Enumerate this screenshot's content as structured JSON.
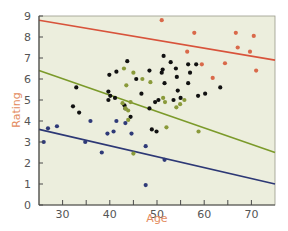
{
  "chart_data": {
    "type": "scatter",
    "title": "",
    "xlabel": "Age",
    "ylabel": "Rating",
    "xlim": [
      25,
      75
    ],
    "ylim": [
      0,
      9
    ],
    "x_ticks": [
      30,
      40,
      50,
      60,
      70
    ],
    "x_minor_ticks": [
      35,
      45,
      55,
      65
    ],
    "y_ticks": [
      0,
      1,
      2,
      3,
      4,
      5,
      6,
      7,
      8,
      9
    ],
    "grid": false,
    "legend": null,
    "colors": {
      "background": "#eceedd",
      "axis": "#4a4a4a",
      "label": "#e38b5e",
      "orange": "#d9694a",
      "black": "#111111",
      "green": "#8a9a3a",
      "blue": "#2f3a78",
      "line_orange": "#d8533b",
      "line_green": "#7b9a2a",
      "line_blue": "#2d3875"
    },
    "series": [
      {
        "name": "orange",
        "points": [
          [
            51,
            8.8
          ],
          [
            57.9,
            8.2
          ],
          [
            66.7,
            8.2
          ],
          [
            70.5,
            8.05
          ],
          [
            67.1,
            7.5
          ],
          [
            56.4,
            7.3
          ],
          [
            59.5,
            6.7
          ],
          [
            64.4,
            6.75
          ],
          [
            69.7,
            7.3
          ],
          [
            61.8,
            6.05
          ],
          [
            71,
            6.4
          ]
        ]
      },
      {
        "name": "black",
        "points": [
          [
            32.9,
            5.6
          ],
          [
            32.2,
            4.7
          ],
          [
            33.5,
            4.4
          ],
          [
            39.9,
            6.2
          ],
          [
            41.4,
            6.35
          ],
          [
            39.7,
            5.4
          ],
          [
            39.7,
            5.0
          ],
          [
            43.7,
            6.85
          ],
          [
            43.1,
            4.75
          ],
          [
            43.3,
            4.6
          ],
          [
            48.4,
            6.4
          ],
          [
            51.4,
            7.1
          ],
          [
            52.9,
            6.8
          ],
          [
            51.2,
            6.45
          ],
          [
            51,
            6.3
          ],
          [
            54,
            6.5
          ],
          [
            54.2,
            6.1
          ],
          [
            56.6,
            6.7
          ],
          [
            57,
            6.3
          ],
          [
            58.3,
            6.7
          ],
          [
            54.4,
            5.45
          ],
          [
            56.6,
            5.8
          ],
          [
            53.5,
            5.0
          ],
          [
            58.7,
            5.2
          ],
          [
            60.2,
            5.3
          ],
          [
            63.4,
            5.6
          ],
          [
            55,
            5.1
          ],
          [
            49.6,
            4.9
          ],
          [
            48.4,
            4.6
          ],
          [
            48.9,
            3.6
          ],
          [
            49.9,
            3.5
          ],
          [
            44.4,
            4.2
          ],
          [
            45.6,
            6.0
          ],
          [
            46.7,
            5.3
          ],
          [
            50.3,
            5.0
          ],
          [
            51.6,
            5.8
          ],
          [
            40.1,
            5.2
          ],
          [
            41.1,
            5.1
          ]
        ]
      },
      {
        "name": "green",
        "points": [
          [
            43,
            6.5
          ],
          [
            45,
            6.3
          ],
          [
            46.9,
            6.0
          ],
          [
            48.6,
            5.85
          ],
          [
            43.5,
            5.7
          ],
          [
            42.7,
            4.85
          ],
          [
            43.3,
            4.6
          ],
          [
            43.9,
            4.5
          ],
          [
            43.9,
            4.05
          ],
          [
            51.3,
            5.1
          ],
          [
            51.7,
            4.9
          ],
          [
            54.9,
            4.8
          ],
          [
            54.1,
            4.65
          ],
          [
            55.8,
            5.0
          ],
          [
            52,
            3.7
          ],
          [
            58.8,
            3.5
          ],
          [
            45,
            2.45
          ],
          [
            44.4,
            4.9
          ]
        ]
      },
      {
        "name": "blue",
        "points": [
          [
            26,
            3.0
          ],
          [
            26.9,
            3.65
          ],
          [
            28.8,
            3.75
          ],
          [
            34.8,
            3.0
          ],
          [
            35.9,
            4.0
          ],
          [
            38.3,
            2.5
          ],
          [
            39.5,
            3.4
          ],
          [
            40.8,
            3.5
          ],
          [
            41.4,
            4.0
          ],
          [
            43.3,
            3.9
          ],
          [
            44.6,
            3.4
          ],
          [
            47.6,
            2.8
          ],
          [
            47.6,
            0.95
          ],
          [
            51.6,
            2.15
          ]
        ]
      }
    ],
    "trend_lines": [
      {
        "name": "orange",
        "from": [
          25,
          8.8
        ],
        "to": [
          75,
          6.9
        ]
      },
      {
        "name": "green",
        "from": [
          25,
          6.4
        ],
        "to": [
          75,
          2.5
        ]
      },
      {
        "name": "blue",
        "from": [
          25,
          3.6
        ],
        "to": [
          75,
          1.0
        ]
      }
    ]
  }
}
